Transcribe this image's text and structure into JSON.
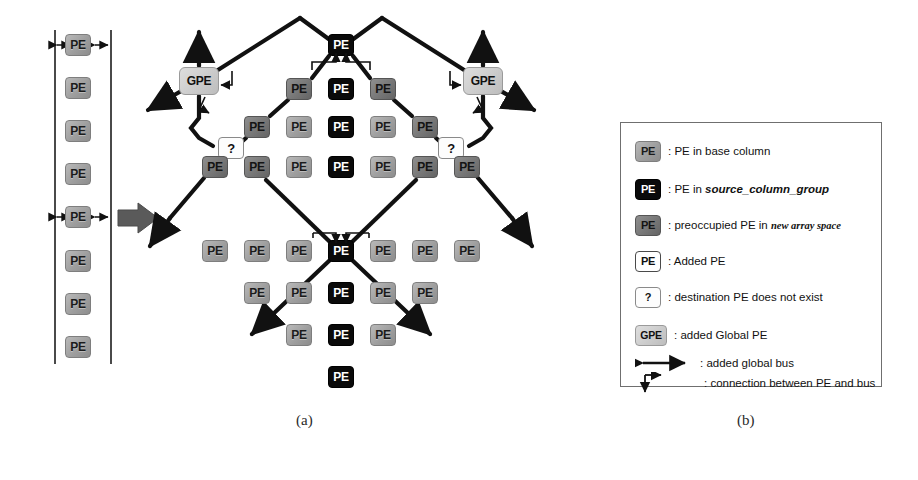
{
  "figure": {
    "caption_a": "(a)",
    "caption_b": "(b)",
    "pe_label": "PE",
    "gpe_label": "GPE",
    "question_label": "?"
  },
  "base_column": {
    "label": "PE",
    "count": 8,
    "marked_rows": [
      1,
      5
    ],
    "boxes": [
      {
        "label": "PE",
        "style": "base",
        "x": 78,
        "y": 45
      },
      {
        "label": "PE",
        "style": "base",
        "x": 78,
        "y": 88
      },
      {
        "label": "PE",
        "style": "base",
        "x": 78,
        "y": 131
      },
      {
        "label": "PE",
        "style": "base",
        "x": 78,
        "y": 174
      },
      {
        "label": "PE",
        "style": "base",
        "x": 78,
        "y": 217
      },
      {
        "label": "PE",
        "style": "base",
        "x": 78,
        "y": 261
      },
      {
        "label": "PE",
        "style": "base",
        "x": 78,
        "y": 304
      },
      {
        "label": "PE",
        "style": "base",
        "x": 78,
        "y": 347
      }
    ]
  },
  "array": {
    "nodes": [
      {
        "label": "PE",
        "style": "src",
        "x": 341,
        "y": 45,
        "name": "pe-top-center"
      },
      {
        "label": "GPE",
        "style": "gpe",
        "x": 199,
        "y": 81,
        "name": "gpe-left"
      },
      {
        "label": "PE",
        "style": "pre",
        "x": 299,
        "y": 89,
        "name": "pe-r1-c1"
      },
      {
        "label": "PE",
        "style": "src",
        "x": 341,
        "y": 89,
        "name": "pe-r1-c2"
      },
      {
        "label": "PE",
        "style": "pre",
        "x": 383,
        "y": 89,
        "name": "pe-r1-c3"
      },
      {
        "label": "GPE",
        "style": "gpe",
        "x": 483,
        "y": 81,
        "name": "gpe-right"
      },
      {
        "label": "PE",
        "style": "pre",
        "x": 257,
        "y": 127,
        "name": "pe-r2-c0"
      },
      {
        "label": "PE",
        "style": "base",
        "x": 299,
        "y": 127,
        "name": "pe-r2-c1"
      },
      {
        "label": "PE",
        "style": "src",
        "x": 341,
        "y": 127,
        "name": "pe-r2-c2"
      },
      {
        "label": "PE",
        "style": "base",
        "x": 383,
        "y": 127,
        "name": "pe-r2-c3"
      },
      {
        "label": "PE",
        "style": "pre",
        "x": 425,
        "y": 127,
        "name": "pe-r2-c4"
      },
      {
        "label": "?",
        "style": "q",
        "x": 231,
        "y": 148,
        "name": "q-left"
      },
      {
        "label": "?",
        "style": "q",
        "x": 451,
        "y": 148,
        "name": "q-right"
      },
      {
        "label": "PE",
        "style": "pre",
        "x": 215,
        "y": 167,
        "name": "pe-r3-cm1"
      },
      {
        "label": "PE",
        "style": "pre",
        "x": 257,
        "y": 167,
        "name": "pe-r3-c0"
      },
      {
        "label": "PE",
        "style": "base",
        "x": 299,
        "y": 167,
        "name": "pe-r3-c1"
      },
      {
        "label": "PE",
        "style": "src",
        "x": 341,
        "y": 167,
        "name": "pe-r3-c2"
      },
      {
        "label": "PE",
        "style": "base",
        "x": 383,
        "y": 167,
        "name": "pe-r3-c3"
      },
      {
        "label": "PE",
        "style": "pre",
        "x": 425,
        "y": 167,
        "name": "pe-r3-c4"
      },
      {
        "label": "PE",
        "style": "pre",
        "x": 467,
        "y": 167,
        "name": "pe-r3-c5"
      },
      {
        "label": "PE",
        "style": "base",
        "x": 215,
        "y": 251,
        "name": "pe-r4-cm1"
      },
      {
        "label": "PE",
        "style": "base",
        "x": 257,
        "y": 251,
        "name": "pe-r4-c0"
      },
      {
        "label": "PE",
        "style": "base",
        "x": 299,
        "y": 251,
        "name": "pe-r4-c1"
      },
      {
        "label": "PE",
        "style": "src",
        "x": 341,
        "y": 251,
        "name": "pe-center-junction"
      },
      {
        "label": "PE",
        "style": "base",
        "x": 383,
        "y": 251,
        "name": "pe-r4-c3"
      },
      {
        "label": "PE",
        "style": "base",
        "x": 425,
        "y": 251,
        "name": "pe-r4-c4"
      },
      {
        "label": "PE",
        "style": "base",
        "x": 467,
        "y": 251,
        "name": "pe-r4-c5"
      },
      {
        "label": "PE",
        "style": "base",
        "x": 257,
        "y": 293,
        "name": "pe-r5-c0"
      },
      {
        "label": "PE",
        "style": "base",
        "x": 299,
        "y": 293,
        "name": "pe-r5-c1"
      },
      {
        "label": "PE",
        "style": "src",
        "x": 341,
        "y": 293,
        "name": "pe-r5-c2"
      },
      {
        "label": "PE",
        "style": "base",
        "x": 383,
        "y": 293,
        "name": "pe-r5-c3"
      },
      {
        "label": "PE",
        "style": "base",
        "x": 425,
        "y": 293,
        "name": "pe-r5-c4"
      },
      {
        "label": "PE",
        "style": "base",
        "x": 299,
        "y": 335,
        "name": "pe-r6-c1"
      },
      {
        "label": "PE",
        "style": "src",
        "x": 341,
        "y": 335,
        "name": "pe-r6-c2"
      },
      {
        "label": "PE",
        "style": "base",
        "x": 383,
        "y": 335,
        "name": "pe-r6-c3"
      },
      {
        "label": "PE",
        "style": "src",
        "x": 341,
        "y": 377,
        "name": "pe-r7-c2"
      }
    ]
  },
  "legend": {
    "title": "",
    "entries": [
      {
        "swatch": "base",
        "swatch_label": "PE",
        "text": ": PE in base column",
        "name": "legend-base-column"
      },
      {
        "swatch": "src",
        "swatch_label": "PE",
        "text": ": PE in source_column_group",
        "name": "legend-source-column-group"
      },
      {
        "swatch": "pre",
        "swatch_label": "PE",
        "text": ": preoccupied PE in new array space",
        "name": "legend-preoccupied-pe"
      },
      {
        "swatch": "added",
        "swatch_label": "PE",
        "text": ": Added PE",
        "name": "legend-added-pe"
      },
      {
        "swatch": "q",
        "swatch_label": "?",
        "text": ": destination PE does not exist",
        "name": "legend-destination-missing"
      },
      {
        "swatch": "gpe",
        "swatch_label": "GPE",
        "text": ": added Global PE",
        "name": "legend-added-global-pe"
      },
      {
        "swatch": "bus",
        "swatch_label": "",
        "text": ": added global bus",
        "name": "legend-added-global-bus"
      },
      {
        "swatch": "conn",
        "swatch_label": "",
        "text": ": connection between PE and bus",
        "name": "legend-pe-bus-connection"
      }
    ],
    "italic_terms": [
      "source_column_group",
      "new array space"
    ]
  },
  "colors": {
    "base_pe": "#9e9e9e",
    "source_pe": "#0a0a0a",
    "preoccupied_pe": "#777777",
    "added_pe": "#ffffff",
    "gpe": "#cacaca",
    "bus": "#111111",
    "flow_arrow": "#5a5a5a",
    "frame": "#4a4a4a"
  }
}
